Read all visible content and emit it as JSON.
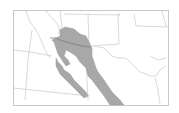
{
  "map": {
    "type": "range-map",
    "region": "Southwestern United States and Northwestern Mexico",
    "colors": {
      "background": "#ffffff",
      "frame": "#c8c8c8",
      "boundary": "#c4c4c4",
      "border": "#808080",
      "range_fill": "#a8a8a8"
    }
  }
}
